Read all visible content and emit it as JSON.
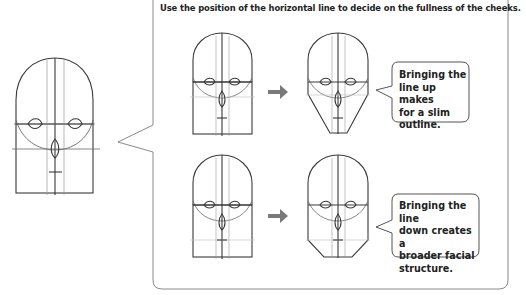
{
  "caption": "Use the position of the horizontal line to decide on the fullness of the cheeks.",
  "examples": [
    {
      "id": "slim",
      "before_label": "face-with-line-up",
      "after_label": "slim-face-outline",
      "note_lines": [
        "Bringing the",
        "line up makes",
        "for a slim",
        "outline."
      ]
    },
    {
      "id": "broad",
      "before_label": "face-with-line-down",
      "after_label": "broad-face-outline",
      "note_lines": [
        "Bringing the line",
        "down creates a",
        "broader facial",
        "structure."
      ]
    }
  ],
  "colors": {
    "stroke": "#3a3a3a",
    "guide": "#9a9a9a",
    "arrow": "#7a7a7a",
    "panel_border": "#8a8a8a"
  }
}
